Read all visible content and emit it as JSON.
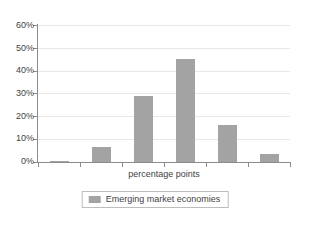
{
  "chart_data": {
    "type": "bar",
    "title": "",
    "xlabel": "percentage points",
    "ylabel": "",
    "ylim": [
      0,
      60
    ],
    "ytick_labels": [
      "60%",
      "50%",
      "40%",
      "30%",
      "20%",
      "10%",
      "0%"
    ],
    "ytick_values": [
      60,
      50,
      40,
      30,
      20,
      10,
      0
    ],
    "grid": true,
    "legend_position": "bottom",
    "categories": [
      "",
      "",
      "",
      "",
      "",
      ""
    ],
    "series": [
      {
        "name": "Emerging market economies",
        "color": "#a3a3a3",
        "values": [
          0.2,
          6.5,
          29,
          45,
          16.3,
          3.5
        ]
      }
    ]
  },
  "legend": {
    "entries": [
      {
        "label": "Emerging market economies",
        "swatch": "legend-swatch-gray"
      }
    ]
  },
  "axis": {
    "x_title": "percentage points"
  },
  "colors": {
    "bar": "#a3a3a3",
    "axis": "#8c8c8c",
    "grid": "#e8e8e8",
    "text": "#3f3f3f",
    "background": "#ffffff"
  }
}
